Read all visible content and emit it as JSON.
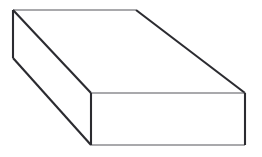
{
  "figure": {
    "shape_name": "cuboid",
    "projection": "oblique",
    "canvas": {
      "width": 262,
      "height": 157,
      "background_color": "#ffffff"
    },
    "style": {
      "thin_stroke_color": "#55555a",
      "thin_stroke_width": 1.1,
      "thick_stroke_color": "#2b2b30",
      "thick_stroke_width": 2.1,
      "face_fill_color": "#ffffff"
    },
    "vertices": {
      "back_top_left": {
        "x": 13,
        "y": 10
      },
      "back_top_right": {
        "x": 136,
        "y": 10
      },
      "back_bottom_left": {
        "x": 13,
        "y": 58
      },
      "front_top_left": {
        "x": 91,
        "y": 93
      },
      "front_top_right": {
        "x": 245,
        "y": 93
      },
      "front_bottom_left": {
        "x": 91,
        "y": 145
      },
      "front_bottom_right": {
        "x": 245,
        "y": 145
      }
    },
    "faces": {
      "top_face_points": "13,10 136,10 245,93 91,93",
      "front_face_points": "91,93 245,93 245,145 91,145",
      "left_face_points": "13,10 91,93 91,145 13,58"
    },
    "edges": [
      {
        "name": "top-back-edge",
        "weight": "thin",
        "points": "13,10 136,10"
      },
      {
        "name": "top-left-diagonal",
        "weight": "thick",
        "points": "13,10 91,93"
      },
      {
        "name": "top-right-diagonal",
        "weight": "thick",
        "points": "136,10 245,93"
      },
      {
        "name": "left-back-vertical",
        "weight": "thick",
        "points": "13,10 13,58"
      },
      {
        "name": "left-bottom-diagonal",
        "weight": "thick",
        "points": "13,58 91,145"
      },
      {
        "name": "front-top-edge",
        "weight": "thin",
        "points": "91,93 245,93"
      },
      {
        "name": "front-bottom-edge",
        "weight": "thin",
        "points": "91,145 245,145"
      },
      {
        "name": "front-left-vertical",
        "weight": "thick",
        "points": "91,93 91,145"
      },
      {
        "name": "front-right-vertical",
        "weight": "thick",
        "points": "245,93 245,145"
      }
    ]
  }
}
